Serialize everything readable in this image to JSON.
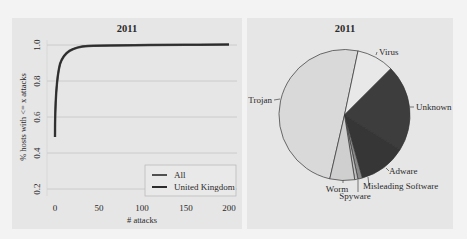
{
  "chart_data": [
    {
      "type": "line",
      "title": "2011",
      "xlabel": "# attacks",
      "ylabel": "% hosts with <= x attacks",
      "xlim": [
        0,
        200
      ],
      "ylim": [
        0.2,
        1.0
      ],
      "xticks": [
        "0",
        "50",
        "100",
        "150",
        "200"
      ],
      "yticks": [
        "0.2",
        "0.4",
        "0.6",
        "0.8",
        "1.0"
      ],
      "grid": "horizontal",
      "legend_position": "lower right",
      "legend": [
        "All",
        "United Kingdom"
      ],
      "series": [
        {
          "name": "All",
          "x": [
            0,
            1,
            2,
            3,
            5,
            8,
            10,
            15,
            20,
            30,
            40,
            50,
            75,
            100,
            150,
            200
          ],
          "y": [
            0.49,
            0.7,
            0.8,
            0.85,
            0.9,
            0.93,
            0.945,
            0.96,
            0.97,
            0.98,
            0.985,
            0.99,
            0.993,
            0.995,
            0.998,
            1.0
          ]
        },
        {
          "name": "United Kingdom",
          "x": [
            0,
            1,
            2,
            3,
            5,
            8,
            10,
            15,
            20,
            30,
            40,
            50,
            75,
            100,
            150,
            200
          ],
          "y": [
            0.49,
            0.7,
            0.8,
            0.85,
            0.9,
            0.93,
            0.945,
            0.96,
            0.97,
            0.98,
            0.985,
            0.99,
            0.993,
            0.995,
            0.998,
            1.0
          ]
        }
      ]
    },
    {
      "type": "pie",
      "title": "2011",
      "categories": [
        "Trojan",
        "Virus",
        "Unknown",
        "Adware",
        "Misleading Software",
        "Spyware",
        "Worm"
      ],
      "values": [
        49.7,
        9.2,
        21.4,
        11.7,
        1.1,
        0.8,
        6.1
      ],
      "colors": [
        "#d9d9d9",
        "#e8e8e8",
        "#3d3d3d",
        "#363636",
        "#8a8a8a",
        "#bdbdbd",
        "#cfcfcf"
      ]
    }
  ],
  "left_chart": {
    "title": "2011",
    "xlabel": "# attacks",
    "ylabel": "% hosts with <= x attacks",
    "xticks": [
      "0",
      "50",
      "100",
      "150",
      "200"
    ],
    "yticks": [
      "0.2",
      "0.4",
      "0.6",
      "0.8",
      "1.0"
    ],
    "legend": [
      "All",
      "United Kingdom"
    ]
  },
  "right_chart": {
    "title": "2011",
    "labels": {
      "trojan": "Trojan",
      "virus": "Virus",
      "unknown": "Unknown",
      "adware": "Adware",
      "misleading": "Misleading Software",
      "spyware": "Spyware",
      "worm": "Worm"
    }
  }
}
